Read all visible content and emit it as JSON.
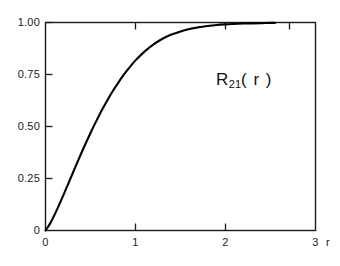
{
  "chart_data": {
    "type": "line",
    "title": "",
    "subtitle": "",
    "xlabel": "r",
    "ylabel": "",
    "annotation": "R21(r)",
    "annotation_parts": {
      "symbol": "R",
      "subscript": "21",
      "argument": "( r )"
    },
    "xlim": [
      0,
      3
    ],
    "ylim": [
      0,
      1.0
    ],
    "xticks": [
      0,
      1,
      2,
      3
    ],
    "xtick_labels": [
      "0",
      "1",
      "2",
      "3"
    ],
    "yticks": [
      0,
      0.25,
      0.5,
      0.75,
      1.0
    ],
    "ytick_labels": [
      "0",
      "0.25",
      "0.50",
      "0.75",
      "1.00"
    ],
    "grid": false,
    "legend": null,
    "frame": "box",
    "line_color": "#000000",
    "background_color": "#ffffff",
    "series": [
      {
        "name": "R21(r)",
        "x": [
          0.0,
          0.05,
          0.1,
          0.15,
          0.2,
          0.25,
          0.3,
          0.35,
          0.4,
          0.45,
          0.5,
          0.55,
          0.6,
          0.65,
          0.7,
          0.75,
          0.8,
          0.85,
          0.9,
          0.95,
          1.0,
          1.1,
          1.2,
          1.3,
          1.4,
          1.5,
          1.6,
          1.7,
          1.8,
          1.9,
          2.0,
          2.1,
          2.2,
          2.3,
          2.4,
          2.5,
          2.55
        ],
        "y": [
          0.0,
          0.033,
          0.075,
          0.122,
          0.171,
          0.222,
          0.273,
          0.324,
          0.374,
          0.422,
          0.469,
          0.514,
          0.557,
          0.597,
          0.636,
          0.672,
          0.705,
          0.737,
          0.766,
          0.793,
          0.818,
          0.86,
          0.895,
          0.922,
          0.942,
          0.957,
          0.969,
          0.977,
          0.983,
          0.988,
          0.991,
          0.993,
          0.995,
          0.996,
          0.997,
          0.998,
          0.998
        ]
      }
    ]
  }
}
